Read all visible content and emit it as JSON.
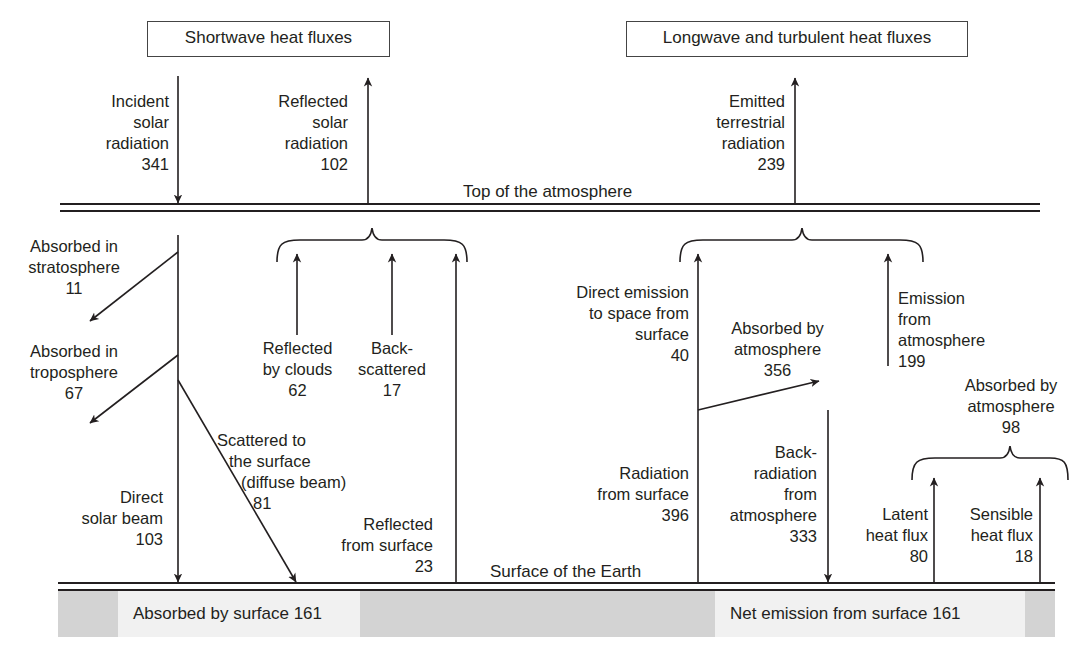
{
  "headers": {
    "shortwave": "Shortwave heat fluxes",
    "longwave": "Longwave and turbulent heat fluxes"
  },
  "levels": {
    "top": "Top of the atmosphere",
    "surface": "Surface of the Earth"
  },
  "shortwave": {
    "incident": {
      "l1": "Incident",
      "l2": "solar",
      "l3": "radiation",
      "value": "341"
    },
    "reflected_total": {
      "l1": "Reflected",
      "l2": "solar",
      "l3": "radiation",
      "value": "102"
    },
    "absorbed_strat": {
      "l1": "Absorbed in",
      "l2": "stratosphere",
      "value": "11"
    },
    "absorbed_trop": {
      "l1": "Absorbed in",
      "l2": "troposphere",
      "value": "67"
    },
    "reflected_clouds": {
      "l1": "Reflected",
      "l2": "by clouds",
      "value": "62"
    },
    "backscattered": {
      "l1": "Back-",
      "l2": "scattered",
      "value": "17"
    },
    "scattered_surface": {
      "l1": "Scattered to",
      "l2": "the surface",
      "l3": "(diffuse beam)",
      "value": "81"
    },
    "direct_beam": {
      "l1": "Direct",
      "l2": "solar beam",
      "value": "103"
    },
    "reflected_surface": {
      "l1": "Reflected",
      "l2": "from surface",
      "value": "23"
    },
    "absorbed_surface": "Absorbed by surface  161"
  },
  "longwave": {
    "emitted": {
      "l1": "Emitted",
      "l2": "terrestrial",
      "l3": "radiation",
      "value": "239"
    },
    "direct_emission": {
      "l1": "Direct emission",
      "l2": "to space from",
      "l3": "surface",
      "value": "40"
    },
    "absorbed_atm": {
      "l1": "Absorbed by",
      "l2": "atmosphere",
      "value": "356"
    },
    "emission_atm": {
      "l1": "Emission",
      "l2": "from",
      "l3": "atmosphere",
      "value": "199"
    },
    "absorbed_atm_turb": {
      "l1": "Absorbed by",
      "l2": "atmosphere",
      "value": "98"
    },
    "radiation_surface": {
      "l1": "Radiation",
      "l2": "from surface",
      "value": "396"
    },
    "back_radiation": {
      "l1": "Back-",
      "l2": "radiation",
      "l3": "from",
      "l4": "atmosphere",
      "value": "333"
    },
    "latent": {
      "l1": "Latent",
      "l2": "heat flux",
      "value": "80"
    },
    "sensible": {
      "l1": "Sensible",
      "l2": "heat flux",
      "value": "18"
    },
    "net_emission": "Net emission from surface  161"
  },
  "colors": {
    "ink": "#231f20",
    "band_dark": "#d3d3d3",
    "band_light": "#f1f1f1"
  }
}
